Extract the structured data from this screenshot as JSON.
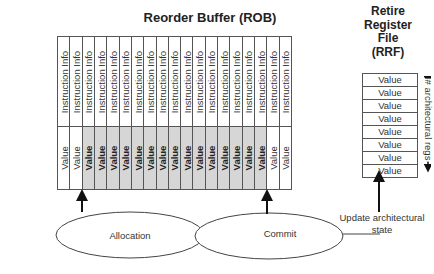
{
  "rob": {
    "title": "Reorder Buffer (ROB)",
    "columns": [
      {
        "info": "Instruction Info",
        "value": "Value",
        "shaded": false
      },
      {
        "info": "Instruction Info",
        "value": "Value",
        "shaded": false
      },
      {
        "info": "Instruction Info",
        "value": "Value",
        "shaded": true
      },
      {
        "info": "Instruction Info",
        "value": "Value",
        "shaded": true
      },
      {
        "info": "Instruction Info",
        "value": "Value",
        "shaded": true
      },
      {
        "info": "Instruction Info",
        "value": "Value",
        "shaded": true
      },
      {
        "info": "Instruction Info",
        "value": "Value",
        "shaded": true
      },
      {
        "info": "Instruction Info",
        "value": "Value",
        "shaded": true
      },
      {
        "info": "Instruction Info",
        "value": "Value",
        "shaded": true
      },
      {
        "info": "Instruction Info",
        "value": "Value",
        "shaded": true
      },
      {
        "info": "Instruction Info",
        "value": "Value",
        "shaded": true
      },
      {
        "info": "Instruction Info",
        "value": "Value",
        "shaded": true
      },
      {
        "info": "Instruction Info",
        "value": "Value",
        "shaded": true
      },
      {
        "info": "Instruction Info",
        "value": "Value",
        "shaded": true
      },
      {
        "info": "Instruction Info",
        "value": "Value",
        "shaded": true
      },
      {
        "info": "Instruction Info",
        "value": "Value",
        "shaded": true
      },
      {
        "info": "Instruction Info",
        "value": "Value",
        "shaded": true
      },
      {
        "info": "Instruction Info",
        "value": "Value",
        "shaded": false
      },
      {
        "info": "Instruction Info",
        "value": "Value",
        "shaded": false
      }
    ],
    "shade_color": "#d6d6d6"
  },
  "rrf": {
    "title_lines": [
      "Retire",
      "Register",
      "File",
      "(RRF)"
    ],
    "rows": [
      "Value",
      "Value",
      "Value",
      "Value",
      "Value",
      "Value",
      "Value",
      "Value"
    ],
    "side_label": "# architectural regs"
  },
  "nodes": {
    "allocation": "Allocation",
    "commit": "Commit",
    "update": "Update architectural state"
  }
}
